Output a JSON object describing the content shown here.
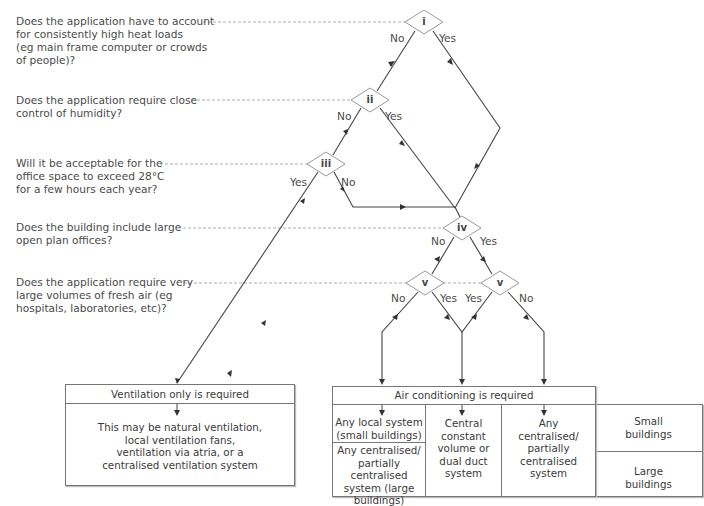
{
  "questions": [
    {
      "id": "i",
      "text": "Does the application have to account for consistently high heat loads (eg main frame computer or crowds of people)?",
      "lines": [
        "Does the application have to account",
        "for consistently high heat loads",
        "(eg main frame computer or crowds",
        "of people)?"
      ]
    },
    {
      "id": "ii",
      "text": "Does the application require close control of humidity?",
      "lines": [
        "Does the application require close",
        "control of humidity?"
      ]
    },
    {
      "id": "iii",
      "text": "Will it be acceptable for the office space to exceed 28°C for a few hours each year?",
      "lines": [
        "Will it be acceptable for the",
        "office space to exceed 28°C",
        "for a few hours each year?"
      ]
    },
    {
      "id": "iv",
      "text": "Does the building include large open plan offices?",
      "lines": [
        "Does the building include large",
        "open plan offices?"
      ]
    },
    {
      "id": "v",
      "text": "Does the application require very large volumes of fresh air (eg hospitals, laboratories, etc)?",
      "lines": [
        "Does the application require very",
        "large volumes of fresh air (eg",
        "hospitals, laboratories, etc)?"
      ]
    }
  ],
  "decisions": {
    "i": "i",
    "ii": "ii",
    "iii": "iii",
    "iv": "iv",
    "v_left": "v",
    "v_right": "v"
  },
  "branch_labels": {
    "yes": "Yes",
    "no": "No"
  },
  "ventilation": {
    "title": "Ventilation only is required",
    "body_lines": [
      "This may be natural ventilation,",
      "local ventilation fans,",
      "ventilation via atria, or a",
      "centralised ventilation system"
    ]
  },
  "air_conditioning": {
    "title": "Air conditioning is required",
    "col1_top_lines": [
      "Any local system",
      "(small buildings)"
    ],
    "col1_bottom_lines": [
      "Any centralised/",
      "partially centralised",
      "system (large",
      "buildings)"
    ],
    "col2_lines": [
      "Central",
      "constant",
      "volume or",
      "dual duct",
      "system"
    ],
    "col3_lines": [
      "Any",
      "centralised/",
      "partially",
      "centralised",
      "system"
    ]
  },
  "legend": {
    "small_lines": [
      "Small",
      "buildings"
    ],
    "large_lines": [
      "Large",
      "buildings"
    ]
  },
  "colors": {
    "line": "#444444",
    "dashed": "#9a9a9a",
    "box_border": "#777777",
    "text": "#4a4a4a"
  }
}
